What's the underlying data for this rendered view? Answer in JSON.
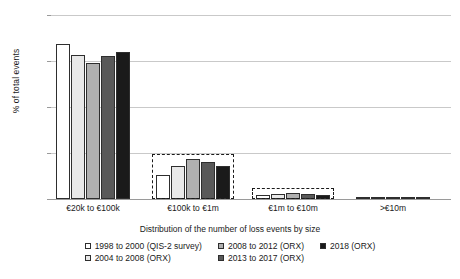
{
  "chart_data": {
    "type": "bar",
    "title": "",
    "xlabel": "Distribution of the number of loss events by size",
    "ylabel": "% of total events",
    "ylim": [
      0,
      100
    ],
    "ytick_labels": [
      "0%",
      "25%",
      "50%",
      "75%",
      "100%"
    ],
    "ytick_values": [
      0,
      25,
      50,
      75,
      100
    ],
    "grid": true,
    "legend_position": "bottom",
    "categories": [
      "€20k to €100k",
      "€100k to €1m",
      "€1m to €10m",
      ">€10m"
    ],
    "series": [
      {
        "name": "1998 to 2000 (QIS-2 survey)",
        "color": "#ffffff",
        "values": [
          84.5,
          13.0,
          2.0,
          0.4
        ]
      },
      {
        "name": "2004 to 2008 (ORX)",
        "color": "#e8e8e8",
        "values": [
          78.5,
          18.0,
          2.6,
          0.5
        ]
      },
      {
        "name": "2008 to 2012 (ORX)",
        "color": "#b0b0b0",
        "values": [
          74.0,
          22.0,
          3.3,
          0.6
        ]
      },
      {
        "name": "2013 to 2017 (ORX)",
        "color": "#595959",
        "values": [
          77.5,
          20.0,
          2.9,
          0.5
        ]
      },
      {
        "name": "2018 (ORX)",
        "color": "#1a1a1a",
        "values": [
          80.0,
          18.0,
          2.4,
          0.4
        ]
      }
    ],
    "highlighted_categories": [
      "€100k to €1m",
      "€1m to €10m"
    ]
  }
}
